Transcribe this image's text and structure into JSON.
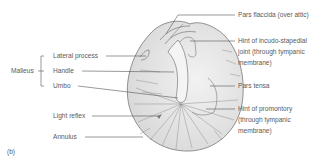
{
  "figure_label": "(b)",
  "group": {
    "label": "Malleus"
  },
  "left_labels": [
    {
      "id": "lateral-process",
      "text": "Lateral process"
    },
    {
      "id": "handle",
      "text": "Handle"
    },
    {
      "id": "umbo",
      "text": "Umbo"
    },
    {
      "id": "light-reflex",
      "text": "Light reflex"
    },
    {
      "id": "annulus",
      "text": "Annulus"
    }
  ],
  "right_labels": [
    {
      "id": "pars-flaccida",
      "lines": [
        "Pars flaccida (over attic)"
      ]
    },
    {
      "id": "incudo-stapedial",
      "lines": [
        "Hint of incudo-stapedial",
        "joint (through tympanic",
        "membrane)"
      ]
    },
    {
      "id": "pars-tensa",
      "lines": [
        "Pars tensa"
      ]
    },
    {
      "id": "promontory",
      "lines": [
        "Hint of promontory",
        "(through tympanic",
        "membrane)"
      ]
    }
  ],
  "colors": {
    "line": "#555555",
    "drum_fill": "#e4e4e4",
    "drum_stroke": "#777777"
  }
}
